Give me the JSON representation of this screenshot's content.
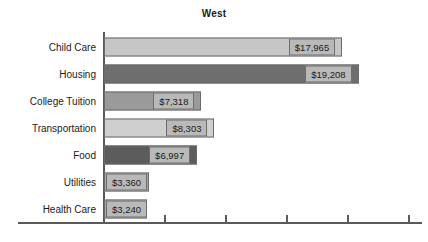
{
  "chart_data": {
    "type": "bar",
    "orientation": "horizontal",
    "title": "West",
    "xlabel": "",
    "ylabel": "",
    "grid": false,
    "legend": false,
    "xlim": [
      0,
      24000
    ],
    "categories": [
      "Child Care",
      "Housing",
      "College Tuition",
      "Transportation",
      "Food",
      "Utilities",
      "Health Care"
    ],
    "values": [
      17965,
      19208,
      7318,
      8303,
      6997,
      3360,
      3240
    ],
    "value_labels": [
      "$17,965",
      "$19,208",
      "$7,318",
      "$8,303",
      "$6,997",
      "$3,360",
      "$3,240"
    ],
    "bar_colors": [
      "#c6c6c6",
      "#6e6e6e",
      "#9a9a9a",
      "#cfcfcf",
      "#5c5c5c",
      "#a8a8a8",
      "#a8a8a8"
    ],
    "x_tick_labels": [
      "",
      "",
      "",
      "",
      ""
    ],
    "axis_color": "#5a5a5a",
    "label_box_color": "#b9b9b9",
    "background": "#ffffff"
  }
}
